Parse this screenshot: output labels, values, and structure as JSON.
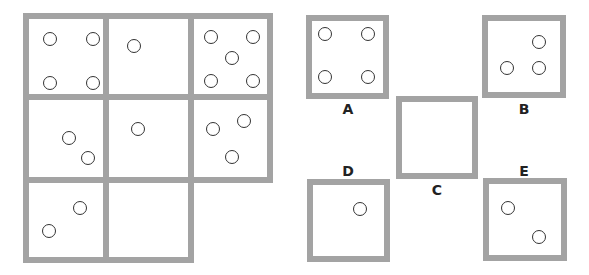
{
  "puzzle": {
    "grid": {
      "cells": [
        {
          "row": 0,
          "col": 0,
          "circles": [
            [
              14,
              13
            ],
            [
              57,
              13
            ],
            [
              14,
              57
            ],
            [
              57,
              57
            ]
          ]
        },
        {
          "row": 0,
          "col": 1,
          "circles": [
            [
              18,
              20
            ]
          ]
        },
        {
          "row": 0,
          "col": 2,
          "circles": [
            [
              10,
              11
            ],
            [
              52,
              11
            ],
            [
              31,
              32
            ],
            [
              10,
              55
            ],
            [
              52,
              55
            ]
          ]
        },
        {
          "row": 1,
          "col": 0,
          "circles": [
            [
              33,
              31
            ],
            [
              52,
              51
            ]
          ]
        },
        {
          "row": 1,
          "col": 1,
          "circles": [
            [
              22,
              22
            ]
          ]
        },
        {
          "row": 1,
          "col": 2,
          "circles": [
            [
              12,
              22
            ],
            [
              43,
              14
            ],
            [
              31,
              50
            ]
          ]
        },
        {
          "row": 2,
          "col": 0,
          "circles": [
            [
              44,
              18
            ],
            [
              13,
              41
            ]
          ]
        },
        {
          "row": 2,
          "col": 1,
          "circles": []
        }
      ]
    },
    "options": [
      {
        "label": "A",
        "circles": [
          [
            6,
            6
          ],
          [
            49,
            6
          ],
          [
            6,
            49
          ],
          [
            49,
            49
          ]
        ]
      },
      {
        "label": "B",
        "circles": [
          [
            44,
            14
          ],
          [
            12,
            40
          ],
          [
            44,
            40
          ]
        ]
      },
      {
        "label": "C",
        "circles": []
      },
      {
        "label": "D",
        "circles": [
          [
            40,
            17
          ]
        ]
      },
      {
        "label": "E",
        "circles": [
          [
            12,
            17
          ],
          [
            43,
            46
          ]
        ]
      }
    ]
  }
}
